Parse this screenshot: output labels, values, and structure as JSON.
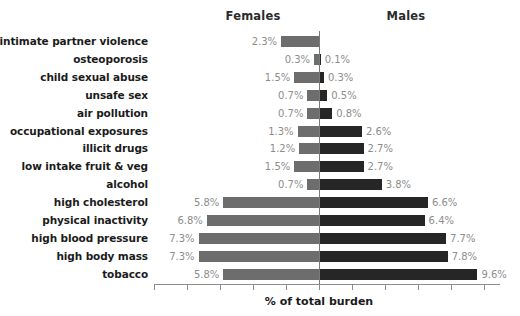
{
  "chart_data": {
    "type": "bar",
    "subtype": "diverging-population-pyramid",
    "title": "",
    "xlabel": "% of total burden",
    "ylabel": "",
    "grid": false,
    "legend_position": "top",
    "axis": {
      "zero_at_px": 319,
      "px_per_percent": 16.5,
      "left_limit_percent": 10.0,
      "right_limit_percent": 11.0,
      "tick_interval_percent": 2,
      "tick_labels_shown": false,
      "ticks_percent": [
        -10,
        -8,
        -6,
        -4,
        -2,
        0,
        2,
        4,
        6,
        8,
        10
      ]
    },
    "categories": [
      "intimate partner violence",
      "osteoporosis",
      "child sexual abuse",
      "unsafe sex",
      "air pollution",
      "occupational exposures",
      "illicit drugs",
      "low intake fruit & veg",
      "alcohol",
      "high cholesterol",
      "physical inactivity",
      "high blood pressure",
      "high body mass",
      "tobacco"
    ],
    "series": [
      {
        "name": "Females",
        "direction": "left",
        "color": "#6d6d6d",
        "values": [
          2.3,
          0.3,
          1.5,
          0.7,
          0.7,
          1.3,
          1.2,
          1.5,
          0.7,
          5.8,
          6.8,
          7.3,
          7.3,
          5.8
        ],
        "labels": [
          "2.3%",
          "0.3%",
          "1.5%",
          "0.7%",
          "0.7%",
          "1.3%",
          "1.2%",
          "1.5%",
          "0.7%",
          "5.8%",
          "6.8%",
          "7.3%",
          "7.3%",
          "5.8%"
        ]
      },
      {
        "name": "Males",
        "direction": "right",
        "color": "#262626",
        "values": [
          0.0,
          0.1,
          0.3,
          0.5,
          0.8,
          2.6,
          2.7,
          2.7,
          3.8,
          6.6,
          6.4,
          7.7,
          7.8,
          9.6
        ],
        "labels": [
          "",
          "0.1%",
          "0.3%",
          "0.5%",
          "0.8%",
          "2.6%",
          "2.7%",
          "2.7%",
          "3.8%",
          "6.6%",
          "6.4%",
          "7.7%",
          "7.8%",
          "9.6%"
        ]
      }
    ]
  },
  "headers": {
    "females": "Females",
    "males": "Males"
  },
  "colors": {
    "female_bar": "#6d6d6d",
    "male_bar": "#262626",
    "value_label": "#8d8d8d",
    "category_label": "#1b1b1b",
    "axis": "#8d8d8d"
  }
}
